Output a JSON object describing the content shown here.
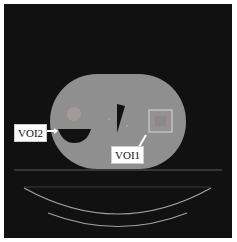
{
  "image": {
    "description": "Axial CT phantom slice with two annotated volumes of interest",
    "background_color": "#111111",
    "phantom_color": "#8f8f8f"
  },
  "annotations": {
    "voi1_label": "VOI1",
    "voi2_label": "VOI2"
  }
}
